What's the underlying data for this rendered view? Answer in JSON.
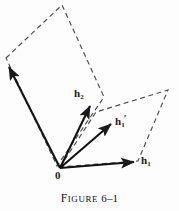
{
  "figure": {
    "caption_lead": "F",
    "caption_rest": "IGURE",
    "caption_number": "6–1",
    "caption_full": "FIGURE 6–1",
    "background_color": "#fdfdfd",
    "ink_color": "#1a1a1a",
    "dash_color": "#555555"
  },
  "labels": {
    "origin": "0",
    "h2_base": "h",
    "h2_sub": "2",
    "h1prime_base": "h",
    "h1prime_sub": "1",
    "h1prime_prime": "′",
    "h1_base": "h",
    "h1_sub": "1"
  },
  "geometry": {
    "origin": [
      60,
      168
    ],
    "vectors": [
      {
        "name": "h2-long-upper-left",
        "from": [
          60,
          168
        ],
        "to": [
          6,
          61
        ],
        "style": "solid-arrow",
        "label": null
      },
      {
        "name": "h2",
        "from": [
          60,
          168
        ],
        "to": [
          92,
          102
        ],
        "style": "solid-arrow",
        "label": "h2"
      },
      {
        "name": "h1-prime",
        "from": [
          60,
          168
        ],
        "to": [
          114,
          122
        ],
        "style": "solid-arrow",
        "label": "h1prime"
      },
      {
        "name": "h1",
        "from": [
          60,
          168
        ],
        "to": [
          138,
          162
        ],
        "style": "solid-arrow",
        "label": "h1"
      }
    ],
    "dashed_parallelogram_left": [
      [
        6,
        58
      ],
      [
        62,
        5
      ],
      [
        104,
        97
      ],
      [
        57,
        166
      ]
    ],
    "dashed_parallelogram_right": [
      [
        60,
        167
      ],
      [
        96,
        112
      ],
      [
        168,
        90
      ],
      [
        138,
        161
      ]
    ]
  }
}
